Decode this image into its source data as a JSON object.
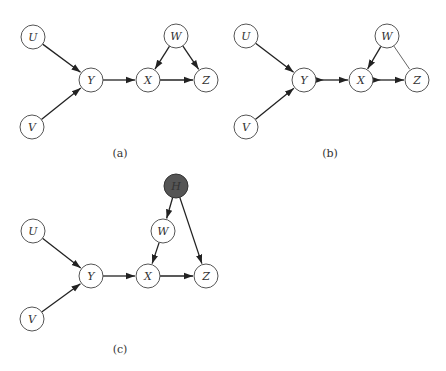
{
  "diagrams": [
    {
      "id": "a",
      "caption": "(a)",
      "caption_pos": [
        120,
        157
      ],
      "nodes": [
        {
          "id": "U",
          "label": "U",
          "x": 33,
          "y": 37,
          "hidden": false
        },
        {
          "id": "V",
          "label": "V",
          "x": 32,
          "y": 127,
          "hidden": false
        },
        {
          "id": "Y",
          "label": "Y",
          "x": 91,
          "y": 80,
          "hidden": false
        },
        {
          "id": "X",
          "label": "X",
          "x": 148,
          "y": 80,
          "hidden": false
        },
        {
          "id": "W",
          "label": "W",
          "x": 176,
          "y": 36,
          "hidden": false
        },
        {
          "id": "Z",
          "label": "Z",
          "x": 206,
          "y": 80,
          "hidden": false
        }
      ],
      "edges": [
        {
          "from": "U",
          "to": "Y",
          "type": "directed"
        },
        {
          "from": "V",
          "to": "Y",
          "type": "directed"
        },
        {
          "from": "Y",
          "to": "X",
          "type": "directed"
        },
        {
          "from": "W",
          "to": "X",
          "type": "directed"
        },
        {
          "from": "W",
          "to": "Z",
          "type": "directed"
        },
        {
          "from": "X",
          "to": "Z",
          "type": "directed"
        }
      ]
    },
    {
      "id": "b",
      "caption": "(b)",
      "caption_pos": [
        330,
        157
      ],
      "nodes": [
        {
          "id": "U",
          "label": "U",
          "x": 246,
          "y": 36,
          "hidden": false
        },
        {
          "id": "V",
          "label": "V",
          "x": 246,
          "y": 127,
          "hidden": false
        },
        {
          "id": "Y",
          "label": "Y",
          "x": 304,
          "y": 80,
          "hidden": false
        },
        {
          "id": "X",
          "label": "X",
          "x": 361,
          "y": 80,
          "hidden": false
        },
        {
          "id": "W",
          "label": "W",
          "x": 387,
          "y": 36,
          "hidden": false
        },
        {
          "id": "Z",
          "label": "Z",
          "x": 417,
          "y": 80,
          "hidden": false
        }
      ],
      "edges": [
        {
          "from": "U",
          "to": "Y",
          "type": "directed"
        },
        {
          "from": "V",
          "to": "Y",
          "type": "directed"
        },
        {
          "from": "Y",
          "to": "X",
          "type": "double-directed"
        },
        {
          "from": "W",
          "to": "X",
          "type": "directed"
        },
        {
          "from": "W",
          "to": "Z",
          "type": "undirected"
        },
        {
          "from": "X",
          "to": "Z",
          "type": "double-directed"
        }
      ]
    },
    {
      "id": "c",
      "caption": "(c)",
      "caption_pos": [
        120,
        353
      ],
      "nodes": [
        {
          "id": "U",
          "label": "U",
          "x": 33,
          "y": 231,
          "hidden": false
        },
        {
          "id": "V",
          "label": "V",
          "x": 32,
          "y": 319,
          "hidden": false
        },
        {
          "id": "Y",
          "label": "Y",
          "x": 91,
          "y": 276,
          "hidden": false
        },
        {
          "id": "X",
          "label": "X",
          "x": 148,
          "y": 276,
          "hidden": false
        },
        {
          "id": "W",
          "label": "W",
          "x": 163,
          "y": 231,
          "hidden": false
        },
        {
          "id": "Z",
          "label": "Z",
          "x": 206,
          "y": 276,
          "hidden": false
        },
        {
          "id": "H",
          "label": "H",
          "x": 176,
          "y": 186,
          "hidden": true
        }
      ],
      "edges": [
        {
          "from": "U",
          "to": "Y",
          "type": "directed"
        },
        {
          "from": "V",
          "to": "Y",
          "type": "directed"
        },
        {
          "from": "Y",
          "to": "X",
          "type": "directed"
        },
        {
          "from": "W",
          "to": "X",
          "type": "directed"
        },
        {
          "from": "H",
          "to": "W",
          "type": "directed"
        },
        {
          "from": "H",
          "to": "Z",
          "type": "directed"
        },
        {
          "from": "X",
          "to": "Z",
          "type": "directed"
        }
      ]
    }
  ],
  "style": {
    "node_radius": 12,
    "hidden_node_fill": "#555555",
    "edge_color": "#222222"
  }
}
